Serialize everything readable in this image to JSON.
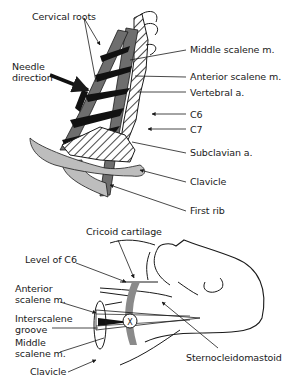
{
  "colors": {
    "muscle_dark": "#6e6e6e",
    "bone_light": "#bdbdbd",
    "nerve_black": "#111111",
    "line": "#1a1a1a",
    "background": "#ffffff"
  },
  "top_panel": {
    "labels": {
      "cervical_roots": "Cervical roots",
      "needle_direction": "Needle\ndirection",
      "middle_scalene": "Middle scalene m.",
      "anterior_scalene": "Anterior scalene m.",
      "vertebral_artery": "Vertebral a.",
      "c6": "C6",
      "c7": "C7",
      "subclavian_artery": "Subclavian a.",
      "clavicle": "Clavicle",
      "first_rib": "First rib"
    }
  },
  "bottom_panel": {
    "labels": {
      "cricoid_cartilage": "Cricoid cartilage",
      "level_of_c6": "Level of C6",
      "anterior_scalene": "Anterior\nscalene m.",
      "interscalene_groove": "Interscalene\ngroove",
      "middle_scalene": "Middle\nscalene m.",
      "clavicle": "Clavicle",
      "sternocleidomastoid": "Sternocleidomastoid",
      "needle_marker": "X"
    }
  }
}
